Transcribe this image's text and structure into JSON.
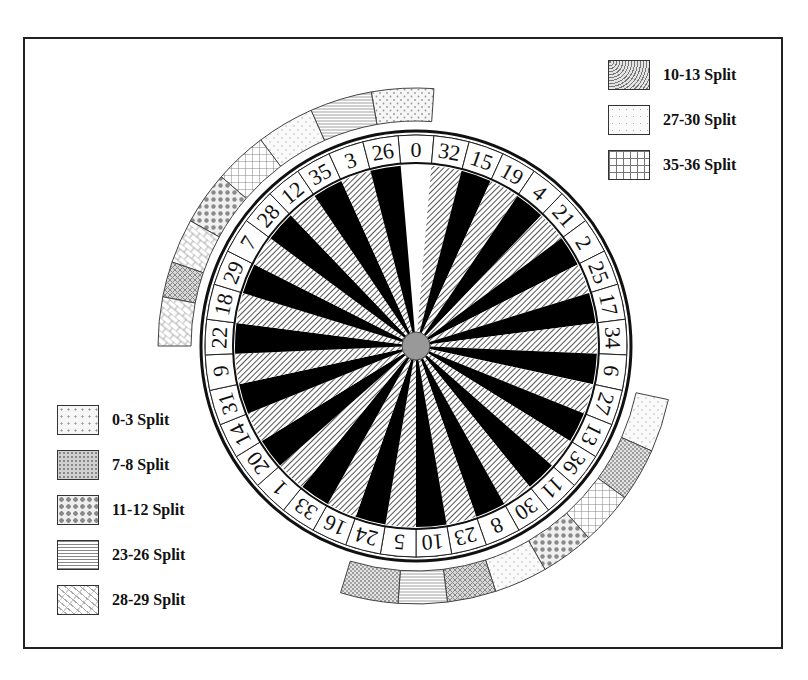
{
  "diagram": {
    "title": "",
    "wheel": {
      "type": "European roulette wheel",
      "pockets": [
        "0",
        "32",
        "15",
        "19",
        "4",
        "21",
        "2",
        "25",
        "17",
        "34",
        "6",
        "27",
        "13",
        "36",
        "11",
        "30",
        "8",
        "23",
        "10",
        "5",
        "24",
        "16",
        "33",
        "1",
        "20",
        "14",
        "31",
        "9",
        "22",
        "18",
        "29",
        "7",
        "28",
        "12",
        "35",
        "3",
        "26"
      ],
      "zero_color": "#ffffff",
      "dark_color": "#000000",
      "hatch_color": "#888888"
    },
    "legend_top_right": [
      {
        "label": "10-13 Split",
        "pattern": "dense-dots"
      },
      {
        "label": "27-30 Split",
        "pattern": "light-dots"
      },
      {
        "label": "35-36 Split",
        "pattern": "grid"
      }
    ],
    "legend_bottom_left": [
      {
        "label": "0-3 Split",
        "pattern": "sparse-dots"
      },
      {
        "label": "7-8 Split",
        "pattern": "checker"
      },
      {
        "label": "11-12 Split",
        "pattern": "diamond-dots"
      },
      {
        "label": "23-26 Split",
        "pattern": "horizontal-lines"
      },
      {
        "label": "28-29 Split",
        "pattern": "brick"
      }
    ],
    "outer_arc_top": [
      "0-3 Split",
      "23-26 Split",
      "27-30 Split",
      "35-36 Split",
      "11-12 Split",
      "28-29 Split",
      "7-8 Split",
      "28-29 Split"
    ],
    "outer_arc_bottom_right": [
      "27-30 Split",
      "10-13 Split",
      "35-36 Split",
      "11-12 Split",
      "27-30 Split",
      "7-8 Split",
      "23-26 Split",
      "10-13 Split"
    ]
  }
}
